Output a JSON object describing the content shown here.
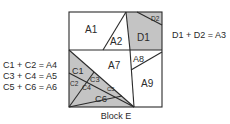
{
  "diagram": {
    "title": "Block E",
    "colors": {
      "shade": "#c4c4c4",
      "line": "#2a2a2a",
      "background": "#ffffff"
    },
    "regions": [
      {
        "id": "A1",
        "label": "A1",
        "shaded": false
      },
      {
        "id": "A2",
        "label": "A2",
        "shaded": false
      },
      {
        "id": "D1",
        "label": "D1",
        "shaded": true
      },
      {
        "id": "D2",
        "label": "D2",
        "shaded": true
      },
      {
        "id": "A7",
        "label": "A7",
        "shaded": false
      },
      {
        "id": "A8",
        "label": "A8",
        "shaded": false
      },
      {
        "id": "A9",
        "label": "A9",
        "shaded": false
      },
      {
        "id": "C1",
        "label": "C1",
        "shaded": true
      },
      {
        "id": "C2",
        "label": "C2",
        "shaded": true
      },
      {
        "id": "C3",
        "label": "C3",
        "shaded": true
      },
      {
        "id": "C4",
        "label": "C4",
        "shaded": true
      },
      {
        "id": "C5",
        "label": "C5",
        "shaded": true
      },
      {
        "id": "C6",
        "label": "C6",
        "shaded": true
      }
    ],
    "equations_left": [
      "C1 + C2 = A4",
      "C3 + C4 = A5",
      "C5 + C6 = A6"
    ],
    "equations_right": [
      "D1 + D2 = A3"
    ]
  }
}
